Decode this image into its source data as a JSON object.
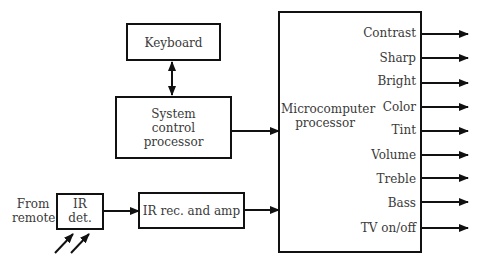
{
  "diagram": {
    "blocks": {
      "keyboard": {
        "label": "Keyboard"
      },
      "system_control": {
        "line1": "System",
        "line2": "control",
        "line3": "processor"
      },
      "microcomputer": {
        "line1": "Microcomputer",
        "line2": "processor"
      },
      "ir_det": {
        "line1": "IR",
        "line2": "det."
      },
      "ir_rec": {
        "label": "IR rec. and amp"
      }
    },
    "input_label": {
      "line1": "From",
      "line2": "remote"
    },
    "outputs": [
      "Contrast",
      "Sharp",
      "Bright",
      "Color",
      "Tint",
      "Volume",
      "Treble",
      "Bass",
      "TV on/off"
    ],
    "colors": {
      "line": "#111111",
      "text": "#3a3a3a",
      "background": "#ffffff"
    }
  }
}
